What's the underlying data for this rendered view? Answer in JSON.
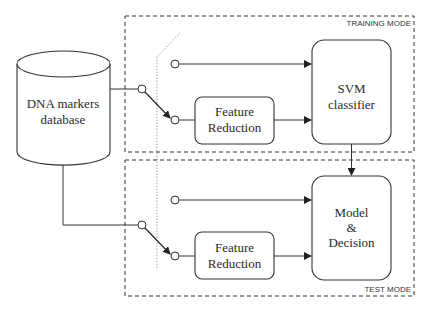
{
  "diagram": {
    "regions": {
      "training": {
        "label": "TRAINING MODE"
      },
      "test": {
        "label": "TEST MODE"
      }
    },
    "nodes": {
      "database": {
        "line1": "DNA markers",
        "line2": "database"
      },
      "feature_reduction_train": {
        "line1": "Feature",
        "line2": "Reduction"
      },
      "svm": {
        "line1": "SVM",
        "line2": "classifier"
      },
      "feature_reduction_test": {
        "line1": "Feature",
        "line2": "Reduction"
      },
      "model": {
        "line1": "Model",
        "line2": "&",
        "line3": "Decision"
      }
    },
    "edges": [
      {
        "from": "database",
        "to": "switch-train"
      },
      {
        "from": "switch-train",
        "to": "feature_reduction_train"
      },
      {
        "from": "bypass-train",
        "to": "svm"
      },
      {
        "from": "feature_reduction_train",
        "to": "svm"
      },
      {
        "from": "svm",
        "to": "model"
      },
      {
        "from": "database",
        "to": "switch-test"
      },
      {
        "from": "switch-test",
        "to": "feature_reduction_test"
      },
      {
        "from": "bypass-test",
        "to": "model"
      },
      {
        "from": "feature_reduction_test",
        "to": "model"
      }
    ]
  }
}
